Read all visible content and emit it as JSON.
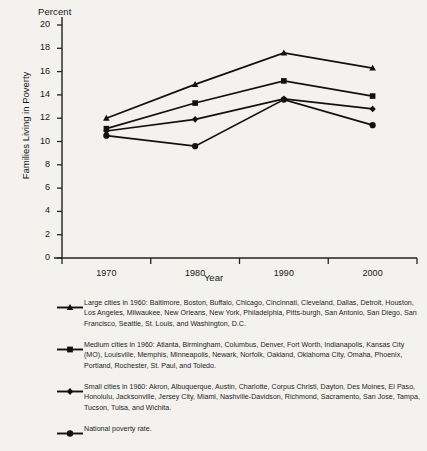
{
  "chart_data": {
    "type": "line",
    "title": "",
    "top_axis_label": "Percent",
    "xlabel": "Year",
    "ylabel": "Families Living in Poverty",
    "categories": [
      "1970",
      "1980",
      "1990",
      "2000"
    ],
    "x": [
      1970,
      1980,
      1990,
      2000
    ],
    "xlim": [
      1965,
      2005
    ],
    "ylim": [
      0,
      20
    ],
    "yticks": [
      0,
      2,
      4,
      6,
      8,
      10,
      12,
      14,
      16,
      18,
      20
    ],
    "ytick_labels": [
      "0",
      "2",
      "4",
      "6",
      "8",
      "10",
      "12",
      "14",
      "16",
      "18",
      "20"
    ],
    "grid": false,
    "legend_position": "below",
    "series": [
      {
        "name": "Large cities in 1960",
        "marker": "triangle",
        "values": [
          12.0,
          14.9,
          17.6,
          16.3
        ]
      },
      {
        "name": "Medium cities in 1960",
        "marker": "square",
        "values": [
          11.1,
          13.3,
          15.2,
          13.9
        ]
      },
      {
        "name": "Small cities in 1960",
        "marker": "diamond",
        "values": [
          10.9,
          11.9,
          13.65,
          12.8
        ]
      },
      {
        "name": "National poverty rate",
        "marker": "circle",
        "values": [
          10.5,
          9.6,
          13.6,
          11.4
        ]
      }
    ]
  },
  "legend": {
    "entries": [
      {
        "marker": "triangle",
        "text": "Large cities in 1960: Baltimore, Boston, Buffalo, Chicago, Cincinnati, Cleveland, Dallas, Detroit, Houston, Los Angeles, Milwaukee, New Orleans, New York, Philadelphia, Pitts-burgh, San Antonio, San Diego, San Francisco, Seattle, St. Louis, and Washington, D.C."
      },
      {
        "marker": "square",
        "text": "Medium cities in 1960: Atlanta, Birmingham, Columbus, Denver, Fort Worth, Indianapolis, Kansas City (MO), Louisville, Memphis, Minneapolis, Newark, Norfolk, Oakland, Oklahoma City, Omaha, Phoenix, Portland, Rochester, St. Paul, and Toledo."
      },
      {
        "marker": "diamond",
        "text": "Small cities in 1960: Akron, Albuquerque, Austin, Charlotte, Corpus Christi, Dayton, Des Moines, El Paso, Honolulu, Jacksonville, Jersey City, Miami, Nashville-Davidson, Richmond, Sacramento, San Jose, Tampa, Tucson, Tulsa, and Wichita."
      },
      {
        "marker": "circle",
        "text": "National poverty rate."
      }
    ]
  },
  "colors": {
    "background": "#f3f2ef",
    "ink": "#1a1a1a",
    "axis": "#222222"
  }
}
